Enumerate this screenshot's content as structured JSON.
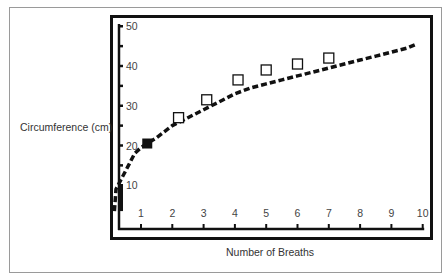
{
  "chart_data": {
    "type": "line",
    "title": "",
    "xlabel": "Number of Breaths",
    "ylabel": "Circumference (cm)",
    "xlim": [
      0,
      10
    ],
    "ylim": [
      0,
      50
    ],
    "x_ticks": [
      1,
      2,
      3,
      4,
      5,
      6,
      7,
      8,
      9,
      10
    ],
    "y_ticks": [
      10,
      20,
      30,
      40,
      50
    ],
    "y_minor_ticks": [
      15,
      25,
      35,
      45
    ],
    "grid": false,
    "legend": null,
    "series": [
      {
        "name": "Inflation curve",
        "style": "dashed-step",
        "color": "#111111",
        "x": [
          0.15,
          0.2,
          0.4,
          0.6,
          0.8,
          1.0,
          1.2,
          1.5,
          2.0,
          2.5,
          3.0,
          3.5,
          4.0,
          4.5,
          5.0,
          5.5,
          6.0,
          6.5,
          7.0,
          7.5,
          8.0,
          8.5,
          9.0,
          9.5,
          9.8
        ],
        "y": [
          3.5,
          9,
          12,
          15,
          18,
          19.5,
          20.5,
          22,
          25,
          27,
          29,
          31,
          33,
          34.5,
          35.5,
          36.5,
          37.5,
          38.5,
          39.5,
          40.5,
          41.5,
          42.5,
          43.5,
          44.5,
          45.5
        ]
      },
      {
        "name": "Measured points",
        "style": "open-square",
        "color": "#111111",
        "x": [
          2.2,
          3.1,
          4.1,
          5.0,
          6.0,
          7.0
        ],
        "y": [
          27,
          31.5,
          36.5,
          39,
          40.5,
          42
        ]
      },
      {
        "name": "Highlighted point",
        "style": "filled-square",
        "color": "#111111",
        "x": [
          1.2
        ],
        "y": [
          20.5
        ]
      }
    ]
  },
  "labels": {
    "xlabel": "Number of Breaths",
    "ylabel": "Circumference (cm)"
  }
}
